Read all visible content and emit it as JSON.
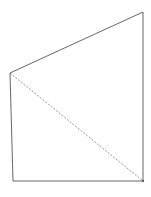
{
  "diagram": {
    "type": "quadrilateral",
    "stroke_color": "#555555",
    "diagonal_color": "#777777",
    "vertices": {
      "top_left": [
        10,
        73
      ],
      "top_right": [
        143,
        12
      ],
      "bottom_right": [
        143,
        181
      ],
      "bottom_left": [
        13,
        181
      ]
    },
    "edges": [
      {
        "from": "top_left",
        "to": "top_right",
        "style": "solid"
      },
      {
        "from": "top_right",
        "to": "bottom_right",
        "style": "solid"
      },
      {
        "from": "bottom_right",
        "to": "bottom_left",
        "style": "solid"
      },
      {
        "from": "bottom_left",
        "to": "top_left",
        "style": "solid"
      },
      {
        "from": "top_left",
        "to": "bottom_right",
        "style": "dashed"
      }
    ]
  }
}
